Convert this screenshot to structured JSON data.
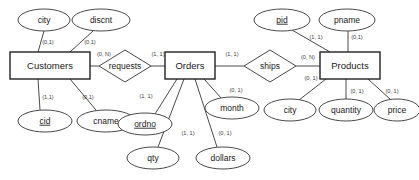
{
  "diagram": {
    "type": "entity-relationship-diagram",
    "entities": [
      {
        "id": "customers",
        "label": "Customers",
        "x": 50,
        "y": 65.5,
        "w": 80,
        "h": 27
      },
      {
        "id": "orders",
        "label": "Orders",
        "x": 190,
        "y": 65.5,
        "w": 50,
        "h": 27
      },
      {
        "id": "products",
        "label": "Products",
        "x": 350,
        "y": 65.5,
        "w": 60,
        "h": 27
      }
    ],
    "relationships": [
      {
        "id": "requests",
        "label": "requests",
        "x": 125,
        "y": 66,
        "rx": 26,
        "ry": 16
      },
      {
        "id": "ships",
        "label": "ships",
        "x": 270,
        "y": 66,
        "rx": 26,
        "ry": 16
      }
    ],
    "attributes": [
      {
        "id": "city-cust",
        "label": "city",
        "x": 44,
        "y": 20,
        "rx": 26,
        "ry": 11,
        "key": false
      },
      {
        "id": "discnt",
        "label": "discnt",
        "x": 101,
        "y": 20,
        "rx": 29,
        "ry": 11,
        "key": false
      },
      {
        "id": "cid",
        "label": "cid",
        "x": 45,
        "y": 121,
        "rx": 27,
        "ry": 11,
        "key": true
      },
      {
        "id": "cname",
        "label": "cname",
        "x": 106,
        "y": 121,
        "rx": 29,
        "ry": 11,
        "key": false
      },
      {
        "id": "ordno",
        "label": "ordno",
        "x": 145,
        "y": 124,
        "rx": 27,
        "ry": 11,
        "key": true
      },
      {
        "id": "qty",
        "label": "qty",
        "x": 153,
        "y": 158,
        "rx": 26,
        "ry": 11,
        "key": false
      },
      {
        "id": "dollars",
        "label": "dollars",
        "x": 223,
        "y": 158,
        "rx": 27,
        "ry": 11,
        "key": false
      },
      {
        "id": "month",
        "label": "month",
        "x": 232,
        "y": 108,
        "rx": 27,
        "ry": 11,
        "key": false
      },
      {
        "id": "pid",
        "label": "pid",
        "x": 282,
        "y": 20,
        "rx": 28,
        "ry": 11,
        "key": true
      },
      {
        "id": "pname",
        "label": "pname",
        "x": 347,
        "y": 20,
        "rx": 28,
        "ry": 11,
        "key": false
      },
      {
        "id": "city-prod",
        "label": "city",
        "x": 290,
        "y": 110,
        "rx": 26,
        "ry": 11,
        "key": false
      },
      {
        "id": "quantity",
        "label": "quantity",
        "x": 346,
        "y": 110,
        "rx": 27,
        "ry": 11,
        "key": false
      },
      {
        "id": "price",
        "label": "price",
        "x": 397,
        "y": 110,
        "rx": 23,
        "ry": 11,
        "key": false
      }
    ],
    "connections": [
      {
        "id": "customers-city",
        "x1": 44,
        "y1": 31,
        "x2": 38,
        "y2": 52
      },
      {
        "id": "customers-discnt",
        "x1": 93,
        "y1": 31,
        "x2": 70,
        "y2": 52
      },
      {
        "id": "customers-cid",
        "x1": 38,
        "y1": 79,
        "x2": 40,
        "y2": 110
      },
      {
        "id": "customers-cname",
        "x1": 70,
        "y1": 79,
        "x2": 96,
        "y2": 110
      },
      {
        "id": "customers-requests",
        "x1": 90,
        "y1": 66,
        "x2": 99,
        "y2": 66
      },
      {
        "id": "requests-orders",
        "x1": 151,
        "y1": 66,
        "x2": 165,
        "y2": 66
      },
      {
        "id": "orders-ordno",
        "x1": 177,
        "y1": 79,
        "x2": 155,
        "y2": 114
      },
      {
        "id": "orders-qty",
        "x1": 184,
        "y1": 79,
        "x2": 158,
        "y2": 147
      },
      {
        "id": "orders-dollars",
        "x1": 195,
        "y1": 79,
        "x2": 217,
        "y2": 147
      },
      {
        "id": "orders-month",
        "x1": 204,
        "y1": 79,
        "x2": 222,
        "y2": 99
      },
      {
        "id": "orders-ships",
        "x1": 215,
        "y1": 66,
        "x2": 244,
        "y2": 66
      },
      {
        "id": "ships-products",
        "x1": 296,
        "y1": 66,
        "x2": 320,
        "y2": 66
      },
      {
        "id": "products-pid",
        "x1": 330,
        "y1": 52,
        "x2": 292,
        "y2": 30
      },
      {
        "id": "products-pname",
        "x1": 348,
        "y1": 52,
        "x2": 348,
        "y2": 31
      },
      {
        "id": "products-city",
        "x1": 326,
        "y1": 79,
        "x2": 299,
        "y2": 100
      },
      {
        "id": "products-quantity",
        "x1": 346,
        "y1": 79,
        "x2": 346,
        "y2": 99
      },
      {
        "id": "products-price",
        "x1": 368,
        "y1": 79,
        "x2": 390,
        "y2": 99
      }
    ],
    "cardinalities": [
      {
        "id": "card-city-cust",
        "text": "(0,1)",
        "x": 48,
        "y": 43
      },
      {
        "id": "card-discnt",
        "text": "(0,1)",
        "x": 90,
        "y": 43
      },
      {
        "id": "card-requests-left",
        "text": "(0, N)",
        "x": 104,
        "y": 55
      },
      {
        "id": "card-requests-right",
        "text": "(1, 1)",
        "x": 158,
        "y": 55
      },
      {
        "id": "card-cid",
        "text": "(1,1)",
        "x": 48,
        "y": 98
      },
      {
        "id": "card-cname",
        "text": "(0,1)",
        "x": 88,
        "y": 98
      },
      {
        "id": "card-ordno",
        "text": "(1, 1)",
        "x": 146,
        "y": 97
      },
      {
        "id": "card-qty",
        "text": "(1, 1)",
        "x": 188,
        "y": 134
      },
      {
        "id": "card-dollars",
        "text": "(0, 1)",
        "x": 225,
        "y": 134
      },
      {
        "id": "card-month",
        "text": "(0, 1)",
        "x": 236,
        "y": 91
      },
      {
        "id": "card-ships-left",
        "text": "(1, 1)",
        "x": 232,
        "y": 55
      },
      {
        "id": "card-ships-right",
        "text": "(0, N)",
        "x": 308,
        "y": 58
      },
      {
        "id": "card-pid",
        "text": "(1, 1)",
        "x": 316,
        "y": 38
      },
      {
        "id": "card-pname",
        "text": "(0,1)",
        "x": 357,
        "y": 38
      },
      {
        "id": "card-city-prod",
        "text": "(0, 1)",
        "x": 311,
        "y": 79
      },
      {
        "id": "card-quantity",
        "text": "(0, 1)",
        "x": 357,
        "y": 92
      },
      {
        "id": "card-price",
        "text": "(0, 1)",
        "x": 392,
        "y": 92
      }
    ]
  }
}
